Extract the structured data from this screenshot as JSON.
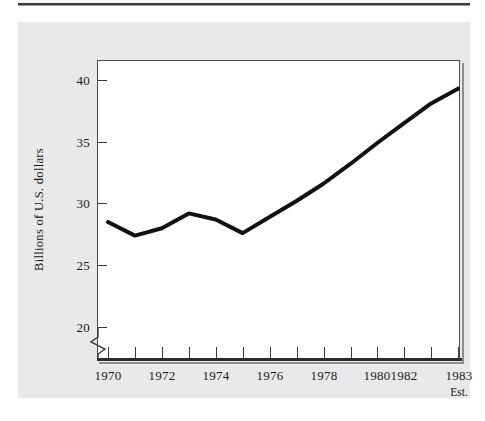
{
  "chart_data": {
    "type": "line",
    "title": "",
    "subtitle": "",
    "xlabel": "",
    "ylabel": "Billions of  U.S. dollars",
    "x": [
      1970,
      1971,
      1972,
      1973,
      1974,
      1975,
      1976,
      1977,
      1978,
      1979,
      1980,
      1981,
      1982,
      1983
    ],
    "values": [
      28.5,
      27.4,
      28.0,
      29.2,
      28.7,
      27.6,
      28.9,
      30.2,
      31.6,
      33.2,
      34.9,
      36.5,
      38.1,
      39.3
    ],
    "series": [
      {
        "name": "Billions of U.S. dollars",
        "values": [
          28.5,
          27.4,
          28.0,
          29.2,
          28.7,
          27.6,
          28.9,
          30.2,
          31.6,
          33.2,
          34.9,
          36.5,
          38.1,
          39.3
        ]
      }
    ],
    "xlim": [
      1970,
      1983
    ],
    "ylim": [
      17.5,
      41.5
    ],
    "y_ticks": [
      "40",
      "35",
      "30",
      "25",
      "20"
    ],
    "y_tick_values": [
      40,
      35,
      30,
      25,
      20
    ],
    "x_ticks": [
      "1970",
      "1972",
      "1974",
      "1976",
      "1978",
      "1980",
      "1982",
      "1983"
    ],
    "x_tick_values": [
      1970,
      1972,
      1974,
      1976,
      1978,
      1980,
      1982,
      1983
    ],
    "x_minor_tick_values": [
      1971,
      1973,
      1975,
      1977,
      1979,
      1981
    ],
    "annotations": [
      {
        "label": "Est.",
        "at_x": 1983,
        "note": "estimate marker under 1983 tick"
      }
    ],
    "axis_break": true,
    "grid": false,
    "legend": "none",
    "line_color": "#111111",
    "line_width_px": 4
  },
  "figure": {
    "panel_background": "#e9e9e9",
    "plot_background": "#ffffff",
    "frame_color": "#4a4a4a",
    "text_color": "#1a1a1a"
  }
}
